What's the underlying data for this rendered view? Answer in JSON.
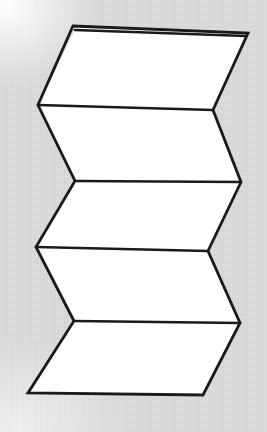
{
  "figure": {
    "canvas": {
      "width": 267,
      "height": 432
    },
    "colors": {
      "background": "#d5d5d5",
      "panel_fill": "#ffffff",
      "stroke": "#1a1a1a"
    },
    "stroke_width": 2.6,
    "panel_count": 6,
    "vertices": {
      "left_edge": [
        {
          "name": "top-left",
          "x": 73,
          "y": 26
        },
        {
          "name": "left-fold-1",
          "x": 38,
          "y": 105
        },
        {
          "name": "left-fold-2",
          "x": 75,
          "y": 181
        },
        {
          "name": "left-fold-3",
          "x": 36,
          "y": 247
        },
        {
          "name": "left-fold-4",
          "x": 74,
          "y": 321
        },
        {
          "name": "bottom-left",
          "x": 28,
          "y": 393
        }
      ],
      "right_edge": [
        {
          "name": "top-right",
          "x": 248,
          "y": 33
        },
        {
          "name": "right-fold-1",
          "x": 213,
          "y": 110
        },
        {
          "name": "right-fold-2",
          "x": 241,
          "y": 182
        },
        {
          "name": "right-fold-3",
          "x": 208,
          "y": 251
        },
        {
          "name": "right-fold-4",
          "x": 240,
          "y": 323
        },
        {
          "name": "bottom-right",
          "x": 203,
          "y": 395
        }
      ],
      "sliver_top": [
        {
          "name": "sliver-left",
          "x": 75,
          "y": 30
        },
        {
          "name": "sliver-right",
          "x": 246,
          "y": 36
        }
      ]
    },
    "panels": [
      {
        "name": "sliver-panel",
        "points": "73,26 248,33 246,36 75,30"
      },
      {
        "name": "panel-1",
        "points": "75,30 246,36 213,110 38,105"
      },
      {
        "name": "panel-2",
        "points": "38,105 213,110 241,182 75,181"
      },
      {
        "name": "panel-3",
        "points": "75,181 241,182 208,251 36,247"
      },
      {
        "name": "panel-4",
        "points": "36,247 208,251 240,323 74,321"
      },
      {
        "name": "panel-5",
        "points": "74,321 240,323 203,395 28,393"
      }
    ],
    "fold_lines": [
      {
        "name": "fold-line-top-sliver",
        "x1": 75,
        "y1": 30,
        "x2": 246,
        "y2": 36
      },
      {
        "name": "fold-line-1",
        "x1": 38,
        "y1": 105,
        "x2": 213,
        "y2": 110
      },
      {
        "name": "fold-line-2",
        "x1": 75,
        "y1": 181,
        "x2": 241,
        "y2": 182
      },
      {
        "name": "fold-line-3",
        "x1": 36,
        "y1": 247,
        "x2": 208,
        "y2": 251
      },
      {
        "name": "fold-line-4",
        "x1": 74,
        "y1": 321,
        "x2": 240,
        "y2": 323
      }
    ],
    "outline": "73,26 248,33 213,110 241,182 208,251 240,323 203,395 28,393 74,321 36,247 75,181 38,105"
  }
}
